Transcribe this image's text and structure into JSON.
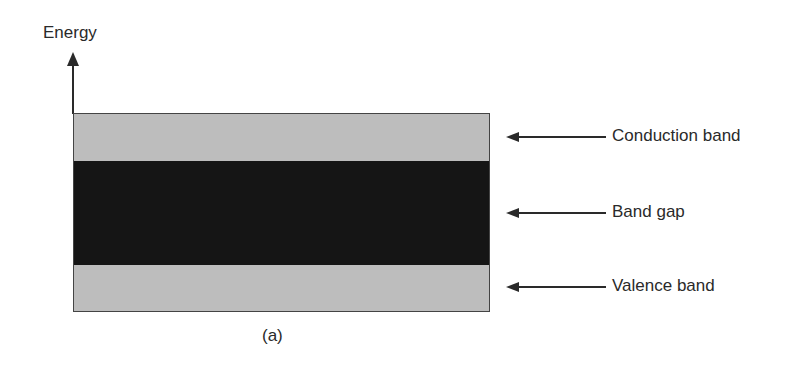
{
  "axis": {
    "label": "Energy",
    "direction": "up"
  },
  "bands": [
    {
      "id": "conduction",
      "label": "Conduction band",
      "color": "#bdbdbd",
      "arrow_y": 137
    },
    {
      "id": "gap",
      "label": "Band gap",
      "color": "#151515",
      "arrow_y": 213
    },
    {
      "id": "valence",
      "label": "Valence band",
      "color": "#bdbdbd",
      "arrow_y": 287
    }
  ],
  "caption": "(a)"
}
